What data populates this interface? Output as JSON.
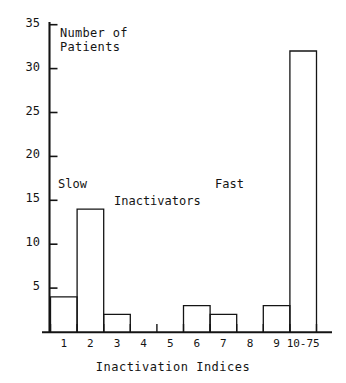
{
  "chart_data": {
    "type": "bar",
    "title": "",
    "xlabel": "Inactivation Indices",
    "ylabel": "Number of\nPatients",
    "ylabel_line1": "Number of",
    "ylabel_line2": "Patients",
    "categories": [
      "1",
      "2",
      "3",
      "4",
      "5",
      "6",
      "7",
      "8",
      "9",
      "10-75"
    ],
    "bin_edges": [
      0,
      1,
      2,
      3,
      4,
      5,
      6,
      7,
      8,
      9,
      10
    ],
    "values": [
      4,
      14,
      2,
      0,
      0,
      3,
      2,
      0,
      3,
      32
    ],
    "ylim": [
      0,
      37
    ],
    "yticks": [
      5,
      10,
      15,
      20,
      25,
      30,
      35
    ],
    "ytick_labels": [
      "5",
      "10",
      "15",
      "20",
      "25",
      "30",
      "35"
    ],
    "xtick_labels": [
      "1",
      "2",
      "3",
      "4",
      "5",
      "6",
      "7",
      "8",
      "9",
      "10-75"
    ],
    "grid": false,
    "legend": "none",
    "annotations": [
      {
        "text": "Slow",
        "x": 1.0,
        "y": 16.5
      },
      {
        "text": "Inactivators",
        "x": 4.4,
        "y": 14.5
      },
      {
        "text": "Fast",
        "x": 8.3,
        "y": 16.5
      }
    ],
    "bar_style": {
      "fill": "none",
      "edge": "#141414",
      "linewidth": 1.3
    }
  },
  "labels": {
    "yaxis_line1": "Number of",
    "yaxis_line2": "Patients",
    "xaxis_title": "Inactivation Indices",
    "group_slow": "Slow",
    "group_inactivators": "Inactivators",
    "group_fast": "Fast"
  },
  "colors": {
    "background": "#ffffff",
    "ink": "#141414",
    "axis": "#141414"
  }
}
